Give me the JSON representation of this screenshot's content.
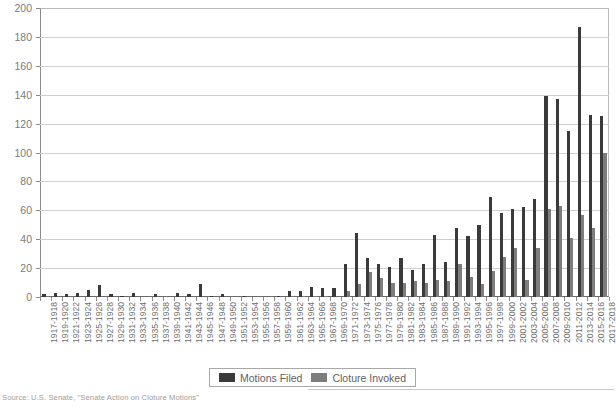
{
  "chart_data": {
    "type": "bar",
    "title": "",
    "subtitle": "",
    "xlabel": "",
    "ylabel": "",
    "ylim": [
      0,
      200
    ],
    "ytick_step": 20,
    "yticks": [
      0,
      20,
      40,
      60,
      80,
      100,
      120,
      140,
      160,
      180,
      200
    ],
    "grid": true,
    "legend_position": "bottom-center",
    "categories": [
      "1917-1918",
      "1919-1920",
      "1921-1922",
      "1923-1924",
      "1925-1926",
      "1927-1928",
      "1929-1930",
      "1931-1932",
      "1933-1934",
      "1935-1936",
      "1937-1938",
      "1939-1940",
      "1941-1942",
      "1943-1944",
      "1945-1946",
      "1947-1948",
      "1949-1950",
      "1951-1952",
      "1953-1954",
      "1955-1956",
      "1957-1958",
      "1959-1960",
      "1961-1962",
      "1963-1964",
      "1965-1966",
      "1967-1968",
      "1969-1970",
      "1971-1972",
      "1973-1974",
      "1975-1976",
      "1977-1978",
      "1979-1980",
      "1981-1982",
      "1983-1984",
      "1985-1986",
      "1987-1988",
      "1989-1990",
      "1991-1992",
      "1993-1994",
      "1995-1996",
      "1997-1998",
      "1999-2000",
      "2001-2002",
      "2003-2004",
      "2005-2006",
      "2007-2008",
      "2009-2010",
      "2011-2012",
      "2013-2014",
      "2015-2016",
      "2017-2018"
    ],
    "series": [
      {
        "name": "Motions Filed",
        "color": "#3a3a3a",
        "values": [
          2,
          3,
          2,
          3,
          5,
          8,
          2,
          1,
          3,
          0,
          2,
          0,
          3,
          2,
          9,
          1,
          2,
          0,
          1,
          0,
          0,
          1,
          4,
          4,
          7,
          6,
          6,
          23,
          44,
          27,
          23,
          21,
          27,
          19,
          23,
          43,
          24,
          48,
          42,
          50,
          69,
          58,
          61,
          62,
          68,
          139,
          137,
          115,
          187,
          126,
          125
        ]
      },
      {
        "name": "Cloture Invoked",
        "color": "#7d7d7d",
        "values": [
          1,
          0,
          0,
          0,
          0,
          0,
          0,
          0,
          0,
          0,
          0,
          0,
          0,
          0,
          0,
          0,
          0,
          0,
          0,
          0,
          0,
          0,
          1,
          1,
          1,
          1,
          0,
          4,
          9,
          17,
          13,
          10,
          10,
          11,
          10,
          12,
          11,
          23,
          14,
          9,
          18,
          28,
          34,
          12,
          34,
          61,
          63,
          41,
          57,
          48,
          100
        ]
      }
    ]
  },
  "legend": {
    "items": [
      {
        "label": "Motions Filed",
        "color": "#3a3a3a"
      },
      {
        "label": "Cloture Invoked",
        "color": "#7d7d7d"
      }
    ]
  },
  "source": {
    "text": "Source: U.S. Senate, \"Senate Action on Cloture Motions\""
  }
}
